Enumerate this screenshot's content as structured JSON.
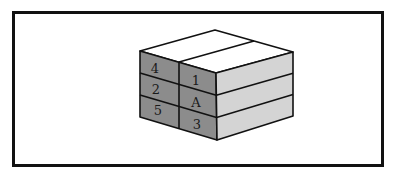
{
  "figure": {
    "colors": {
      "top_face": "#ffffff",
      "front_face": "#8c8c8c",
      "side_face": "#d4d4d4",
      "edge": "#111111",
      "frame": "#111111"
    },
    "front_labels": {
      "left_column": [
        "4",
        "2",
        "5"
      ],
      "right_column": [
        "1",
        "A",
        "3"
      ]
    }
  }
}
